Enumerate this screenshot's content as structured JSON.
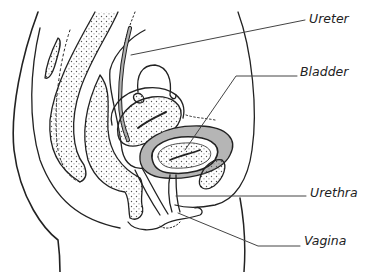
{
  "diagram": {
    "type": "anatomical sagittal section",
    "labels": [
      {
        "id": "ureter",
        "text": "Ureter",
        "x": 309,
        "y": 12
      },
      {
        "id": "bladder",
        "text": "Bladder",
        "x": 300,
        "y": 65
      },
      {
        "id": "urethra",
        "text": "Urethra",
        "x": 310,
        "y": 186
      },
      {
        "id": "vagina",
        "text": "Vagina",
        "x": 304,
        "y": 234
      }
    ],
    "colors": {
      "line": "#222222",
      "bladder_wall": "#b5b5b5",
      "ureter_fill": "#b0b0b0",
      "leader": "#444444",
      "background": "#ffffff"
    }
  }
}
